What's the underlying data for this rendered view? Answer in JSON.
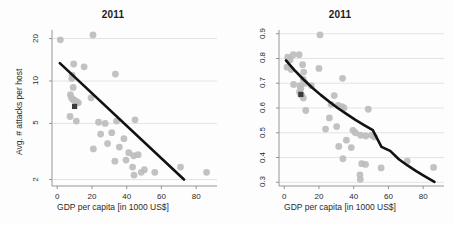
{
  "figure": {
    "background_color": "#fdfdfd",
    "point_color": "#bdbdbd",
    "highlight_color": "#3a3a3a",
    "trend_color": "#121212",
    "grid_color": "#d8d8d8",
    "axis_color": "#8a8a8a"
  },
  "chart_data": [
    {
      "type": "scatter",
      "panel": "left",
      "title": "2011",
      "xlabel": "GDP per capita [in 1000 US$]",
      "ylabel": "Avg. # attacks per host",
      "xlim": [
        -3,
        92
      ],
      "ylim": [
        1.8,
        23
      ],
      "yscale": "log",
      "xscale": "linear",
      "grid": true,
      "xticks": [
        0,
        20,
        40,
        60,
        80
      ],
      "xticklabels": [
        "0",
        "20",
        "40",
        "60",
        "80"
      ],
      "yticks": [
        2,
        5,
        10,
        20
      ],
      "yticklabels": [
        "2",
        "5",
        "10",
        "20"
      ],
      "legend": "none",
      "points": [
        [
          1.8,
          19.6
        ],
        [
          20.6,
          21.2
        ],
        [
          9.5,
          13.2
        ],
        [
          15.5,
          12.6
        ],
        [
          8.6,
          11.0
        ],
        [
          33.5,
          11.2
        ],
        [
          8.4,
          10.4
        ],
        [
          9.2,
          9.0
        ],
        [
          7.6,
          8.0
        ],
        [
          8.2,
          7.6
        ],
        [
          9.0,
          7.4
        ],
        [
          9.8,
          7.3
        ],
        [
          10.6,
          7.2
        ],
        [
          11.4,
          7.1
        ],
        [
          12.2,
          7.0
        ],
        [
          19.5,
          7.6
        ],
        [
          7.4,
          5.6
        ],
        [
          11.0,
          5.2
        ],
        [
          23.8,
          5.1
        ],
        [
          27.6,
          5.0
        ],
        [
          34.2,
          5.2
        ],
        [
          44.8,
          5.3
        ],
        [
          25.0,
          4.2
        ],
        [
          31.4,
          4.3
        ],
        [
          29.0,
          3.6
        ],
        [
          38.4,
          3.9
        ],
        [
          20.8,
          3.3
        ],
        [
          35.8,
          3.4
        ],
        [
          41.2,
          3.1
        ],
        [
          44.0,
          2.95
        ],
        [
          46.6,
          3.0
        ],
        [
          33.2,
          2.7
        ],
        [
          39.6,
          2.75
        ],
        [
          43.4,
          2.45
        ],
        [
          50.2,
          2.35
        ],
        [
          44.2,
          2.15
        ],
        [
          48.4,
          2.25
        ],
        [
          56.2,
          2.25
        ],
        [
          71.0,
          2.45
        ],
        [
          86.0,
          2.25
        ]
      ],
      "highlight_point": [
        10.0,
        6.6
      ],
      "trend": {
        "type": "line-loglinear",
        "points": [
          [
            1.5,
            13.4
          ],
          [
            73.0,
            2.0
          ]
        ]
      }
    },
    {
      "type": "scatter",
      "panel": "right",
      "title": "2011",
      "xlabel": "GDP per capita [in 1000 US$]",
      "ylabel": "% attacked hosts",
      "xlim": [
        -3,
        92
      ],
      "ylim": [
        0.285,
        0.915
      ],
      "yscale": "linear",
      "xscale": "linear",
      "grid": true,
      "xticks": [
        0,
        20,
        40,
        60,
        80
      ],
      "xticklabels": [
        "0",
        "20",
        "40",
        "60",
        "80"
      ],
      "yticks": [
        0.3,
        0.4,
        0.5,
        0.6,
        0.7,
        0.8,
        0.9
      ],
      "yticklabels": [
        "0.3",
        "0.4",
        "0.5",
        "0.6",
        "0.7",
        "0.8",
        "0.9"
      ],
      "legend": "none",
      "points": [
        [
          20.6,
          0.895
        ],
        [
          2.0,
          0.805
        ],
        [
          3.4,
          0.795
        ],
        [
          5.2,
          0.815
        ],
        [
          8.6,
          0.815
        ],
        [
          1.6,
          0.765
        ],
        [
          4.0,
          0.755
        ],
        [
          10.6,
          0.775
        ],
        [
          11.2,
          0.745
        ],
        [
          20.0,
          0.76
        ],
        [
          11.0,
          0.715
        ],
        [
          12.0,
          0.7
        ],
        [
          33.6,
          0.72
        ],
        [
          5.4,
          0.695
        ],
        [
          9.0,
          0.69
        ],
        [
          9.6,
          0.68
        ],
        [
          15.6,
          0.69
        ],
        [
          8.8,
          0.665
        ],
        [
          9.4,
          0.655
        ],
        [
          10.2,
          0.65
        ],
        [
          11.0,
          0.64
        ],
        [
          28.8,
          0.65
        ],
        [
          12.4,
          0.59
        ],
        [
          27.0,
          0.615
        ],
        [
          31.0,
          0.61
        ],
        [
          33.2,
          0.605
        ],
        [
          34.4,
          0.6
        ],
        [
          48.4,
          0.595
        ],
        [
          26.0,
          0.56
        ],
        [
          23.8,
          0.515
        ],
        [
          30.2,
          0.525
        ],
        [
          39.6,
          0.51
        ],
        [
          41.0,
          0.5
        ],
        [
          44.0,
          0.49
        ],
        [
          47.0,
          0.487
        ],
        [
          50.4,
          0.49
        ],
        [
          52.0,
          0.483
        ],
        [
          35.8,
          0.47
        ],
        [
          31.4,
          0.445
        ],
        [
          38.6,
          0.44
        ],
        [
          33.8,
          0.395
        ],
        [
          44.6,
          0.375
        ],
        [
          46.8,
          0.372
        ],
        [
          55.8,
          0.358
        ],
        [
          70.8,
          0.385
        ],
        [
          86.0,
          0.36
        ],
        [
          43.6,
          0.33
        ],
        [
          43.8,
          0.312
        ]
      ],
      "highlight_point": [
        9.6,
        0.655
      ],
      "trend": {
        "type": "curve-exponential",
        "points": [
          [
            1.0,
            0.792
          ],
          [
            6.0,
            0.752
          ],
          [
            11.0,
            0.716
          ],
          [
            16.0,
            0.683
          ],
          [
            21.0,
            0.653
          ],
          [
            26.0,
            0.625
          ],
          [
            31.0,
            0.599
          ],
          [
            36.0,
            0.575
          ],
          [
            41.0,
            0.552
          ],
          [
            46.0,
            0.531
          ],
          [
            51.0,
            0.511
          ],
          [
            56.0,
            0.443
          ],
          [
            61.0,
            0.427
          ],
          [
            66.0,
            0.393
          ],
          [
            71.0,
            0.368
          ],
          [
            76.0,
            0.345
          ],
          [
            81.0,
            0.324
          ],
          [
            86.5,
            0.302
          ]
        ]
      }
    }
  ]
}
